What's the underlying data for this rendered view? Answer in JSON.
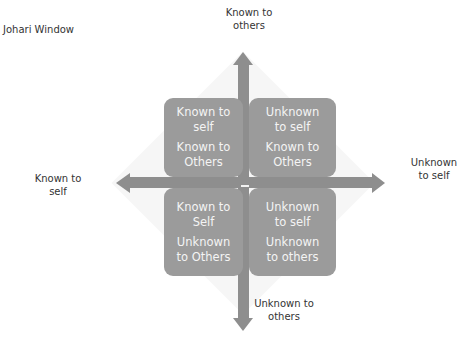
{
  "title": "Johari Window",
  "axes": {
    "top": "Known to\nothers",
    "bottom": "Unknown to\nothers",
    "left": "Known to\nself",
    "right": "Unknown\nto self"
  },
  "quadrants": [
    {
      "position": "top-left",
      "line1": "Known to\nself",
      "line2": "Known to\nOthers"
    },
    {
      "position": "top-right",
      "line1": "Unknown\nto self",
      "line2": "Known to\nOthers"
    },
    {
      "position": "bottom-left",
      "line1": "Known to\nSelf",
      "line2": "Unknown\nto Others"
    },
    {
      "position": "bottom-right",
      "line1": "Unknown\nto self",
      "line2": "Unknown\nto others"
    }
  ],
  "colors": {
    "quadrant_fill": "#9b9b9b",
    "arrow_fill": "#8e8e8e",
    "quadrant_text": "#f4f4f4",
    "label_text": "#333333"
  }
}
